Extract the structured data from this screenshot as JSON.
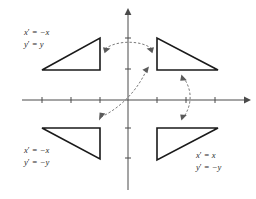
{
  "diagram": {
    "type": "coordinate-plane-transformation",
    "canvas": {
      "width": 256,
      "height": 199
    },
    "colors": {
      "background": "#ffffff",
      "axis": "#4a4a4a",
      "shape_stroke": "#1a1a1a",
      "arrow": "#6b6b6b",
      "text": "#2b2b2b"
    },
    "axes": {
      "origin": {
        "x": 128,
        "y": 100
      },
      "x_axis": {
        "from_x": 22,
        "to_x": 248,
        "y": 100,
        "arrow": "right"
      },
      "y_axis": {
        "x": 128,
        "from_y": 10,
        "to_y": 190,
        "arrow": "up"
      },
      "x_tick_positions": [
        42,
        71,
        100,
        157,
        186,
        215
      ],
      "y_tick_positions": [
        38,
        69,
        128,
        158
      ],
      "grid": false,
      "tick_labels": []
    },
    "shapes": [
      {
        "name": "triangle-quadrant-2",
        "quadrant": "top-left",
        "right_angle_at": "bottom-right",
        "points": "42,70 100,70 100,38"
      },
      {
        "name": "triangle-quadrant-1",
        "quadrant": "top-right",
        "right_angle_at": "bottom-left",
        "points": "157,38 157,70 218,70"
      },
      {
        "name": "triangle-quadrant-3",
        "quadrant": "bottom-left",
        "right_angle_at": "top-right",
        "points": "42,128 100,128 100,159"
      },
      {
        "name": "triangle-quadrant-4",
        "quadrant": "bottom-right",
        "right_angle_at": "top-left",
        "points": "157,128 218,128 157,160"
      }
    ],
    "arrows": [
      {
        "name": "arrow-reflect-y-axis",
        "description": "double-headed arc over the y-axis linking the two upper triangles",
        "path": "M 105,49 C 116,40 142,40 152,49",
        "heads": [
          "start",
          "end"
        ]
      },
      {
        "name": "arrow-reflect-origin",
        "description": "double-headed diagonal arc through the origin linking quadrant 1 and quadrant 3 triangles",
        "path": "M 101,117 C 112,112 134,98 147,69",
        "heads": [
          "start",
          "end"
        ]
      },
      {
        "name": "arrow-reflect-x-axis",
        "description": "double-headed vertical arc on the right linking the two right-hand triangles",
        "path": "M 183,77 C 193,90 192,106 183,118",
        "heads": [
          "start",
          "end"
        ]
      }
    ],
    "labels": [
      {
        "name": "label-quadrant-2",
        "quadrant": "top-left",
        "x": 24,
        "y": 27,
        "line1_prefix": "x",
        "line1_prime": "′",
        "line1_body": " = −x",
        "line2_prefix": "y",
        "line2_prime": "′",
        "line2_body": " = y"
      },
      {
        "name": "label-quadrant-3",
        "quadrant": "bottom-left",
        "x": 24,
        "y": 145,
        "line1_prefix": "x",
        "line1_prime": "′",
        "line1_body": " = −x",
        "line2_prefix": "y",
        "line2_prime": "′",
        "line2_body": " = −y"
      },
      {
        "name": "label-quadrant-4",
        "quadrant": "bottom-right",
        "x": 196,
        "y": 150,
        "line1_prefix": "x",
        "line1_prime": "′",
        "line1_body": " = x",
        "line2_prefix": "y",
        "line2_prime": "′",
        "line2_body": " = −y"
      }
    ]
  }
}
